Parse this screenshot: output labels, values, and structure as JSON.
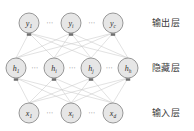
{
  "figure": {
    "type": "neural-network-diagram",
    "background": "#ffffff",
    "node_fill": "#e6e6e6",
    "node_stroke": "#8c8c8c",
    "edge_color": "#c9c9c9",
    "text_color": "#2e2e2e",
    "width": 194,
    "height": 131
  },
  "layers": [
    {
      "id": "output",
      "label": "输出层",
      "label_x": 152,
      "label_y": 19,
      "y": 23,
      "nodes": [
        {
          "id": "y1",
          "base": "y",
          "sub": "1",
          "x": 29
        },
        {
          "id": "yi",
          "base": "y",
          "sub": "i",
          "x": 71
        },
        {
          "id": "yc",
          "base": "y",
          "sub": "c",
          "x": 113
        }
      ],
      "ellipses": [
        {
          "text": "⋯",
          "x": 50
        },
        {
          "text": "⋯",
          "x": 92
        }
      ]
    },
    {
      "id": "hidden",
      "label": "隐藏层",
      "label_x": 152,
      "label_y": 64,
      "y": 68,
      "nodes": [
        {
          "id": "h1",
          "base": "h",
          "sub": "1",
          "x": 16
        },
        {
          "id": "hi",
          "base": "h",
          "sub": "i",
          "x": 54
        },
        {
          "id": "hj",
          "base": "h",
          "sub": "j",
          "x": 91
        },
        {
          "id": "hh",
          "base": "h",
          "sub": "h",
          "x": 128
        }
      ],
      "ellipses": [
        {
          "text": "⋯",
          "x": 35
        },
        {
          "text": "⋯",
          "x": 72.5
        },
        {
          "text": "⋯",
          "x": 109.5
        }
      ]
    },
    {
      "id": "input",
      "label": "输入层",
      "label_x": 152,
      "label_y": 109,
      "y": 113,
      "nodes": [
        {
          "id": "x1",
          "base": "x",
          "sub": "1",
          "x": 29
        },
        {
          "id": "xi",
          "base": "x",
          "sub": "i",
          "x": 71
        },
        {
          "id": "xd",
          "base": "x",
          "sub": "d",
          "x": 113
        }
      ],
      "ellipses": [
        {
          "text": "⋯",
          "x": 50
        },
        {
          "text": "⋯",
          "x": 92
        }
      ]
    }
  ],
  "node_radius": 10,
  "connections": {
    "input_to_hidden": "full-mesh",
    "hidden_to_output": "full-mesh"
  }
}
